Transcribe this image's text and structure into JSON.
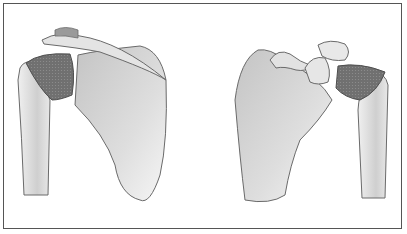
{
  "figure": {
    "panels": [
      {
        "view": "posterior",
        "structures": [
          "scapula",
          "humerus",
          "acromion",
          "rotator-cuff"
        ]
      },
      {
        "view": "anterior",
        "structures": [
          "scapula",
          "humerus",
          "coracoid-process",
          "clavicle",
          "rotator-cuff"
        ]
      }
    ],
    "colors": {
      "border": "#555555",
      "bone_light": "#e8e8e8",
      "bone_shade": "#b8b8b8",
      "cuff": "#6e6e6e",
      "outline": "#6a6a6a"
    }
  }
}
